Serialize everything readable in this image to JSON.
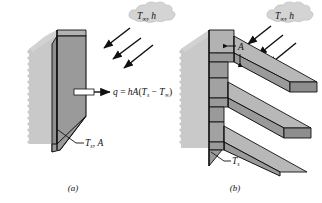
{
  "figure": {
    "type": "technical-diagram",
    "background_color": "#ffffff",
    "line_color": "#000000",
    "surface_fill": "#9a9a9a",
    "surface_top_fill": "#b4b4b4",
    "surface_edge_fill": "#8c8c8c",
    "wall_fill": "#c8c8c8",
    "cloud_fill": "#d2d2d2",
    "callout_fill": "#ffffff"
  },
  "panels": [
    {
      "id": "a",
      "caption": "(a)",
      "description": "Bare plane wall with convection to surrounding fluid",
      "fluid_label": {
        "symbol": "T",
        "subscript": "∞",
        "separator": ", ",
        "coefficient": "h",
        "text": "T∞, h"
      },
      "arrows": {
        "count": 3,
        "direction": "down-left",
        "meaning": "convective fluid flow toward surface"
      },
      "equation": {
        "text": "q = hA(Ts − T∞)",
        "lhs": "q",
        "equals": "=",
        "rhs_prefix": "hA(",
        "rhs_t_s": "T",
        "rhs_t_s_sub": "s",
        "rhs_minus": "−",
        "rhs_t_inf": "T",
        "rhs_t_inf_sub": "∞",
        "rhs_suffix": ")"
      },
      "surface_label": {
        "text": "Ts, A",
        "symbol": "T",
        "subscript": "s",
        "area": "A"
      }
    },
    {
      "id": "b",
      "caption": "(b)",
      "description": "Finned surface with three extended rectangular fins",
      "fluid_label": {
        "symbol": "T",
        "subscript": "∞",
        "separator": ", ",
        "coefficient": "h",
        "text": "T∞, h"
      },
      "arrows": {
        "count": 3,
        "direction": "down-left",
        "meaning": "convective fluid flow toward surface"
      },
      "dimension_label": {
        "text": "A",
        "meaning": "fin surface area indicated between arrowheads"
      },
      "surface_label": {
        "text": "Ts",
        "symbol": "T",
        "subscript": "s"
      },
      "fin_count": 3
    }
  ]
}
